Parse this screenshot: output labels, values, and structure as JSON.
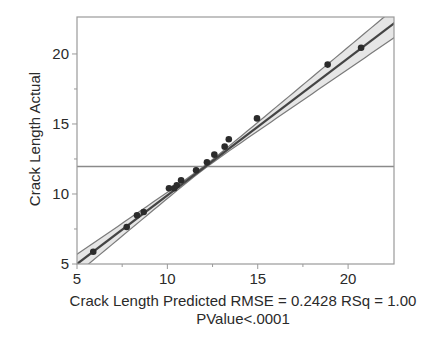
{
  "chart_data": {
    "type": "scatter",
    "title": "",
    "xlabel": "Crack Length Predicted RMSE = 0.2428 RSq = 1.00",
    "xlabel_line2": "PValue<.0001",
    "ylabel": "Crack Length Actual",
    "xlim": [
      5,
      22.54
    ],
    "ylim": [
      5,
      22.64
    ],
    "x_ticks": [
      5,
      10,
      15,
      20
    ],
    "x_minor_ticks": [
      7.5,
      12.5,
      17.5
    ],
    "y_ticks": [
      5,
      10,
      15,
      20
    ],
    "y_minor_ticks": [
      7.5,
      12.5,
      17.5
    ],
    "grid": false,
    "legend": null,
    "points": [
      {
        "x": 5.9,
        "y": 5.88
      },
      {
        "x": 7.75,
        "y": 7.64
      },
      {
        "x": 8.32,
        "y": 8.48
      },
      {
        "x": 8.69,
        "y": 8.71
      },
      {
        "x": 10.09,
        "y": 10.41
      },
      {
        "x": 10.38,
        "y": 10.41
      },
      {
        "x": 10.52,
        "y": 10.62
      },
      {
        "x": 10.76,
        "y": 10.98
      },
      {
        "x": 11.59,
        "y": 11.69
      },
      {
        "x": 12.19,
        "y": 12.26
      },
      {
        "x": 12.6,
        "y": 12.81
      },
      {
        "x": 13.17,
        "y": 13.38
      },
      {
        "x": 13.4,
        "y": 13.91
      },
      {
        "x": 14.96,
        "y": 15.4
      },
      {
        "x": 18.87,
        "y": 19.24
      },
      {
        "x": 20.72,
        "y": 20.44
      }
    ],
    "fit_line": {
      "intercept": 0.1,
      "slope": 0.98
    },
    "confidence_band": {
      "center_x": 12.0,
      "a": 0.012,
      "b": 0.0095
    },
    "mean_line_y": 11.96,
    "stats": {
      "RMSE": 0.2428,
      "RSq": 1.0,
      "PValue": "<.0001"
    }
  },
  "colors": {
    "axis": "#9a9a9a",
    "fit": "#444444",
    "band": "#7a7a7a",
    "band_fill": "#e6e6e6",
    "mean_line": "#8a8a8a",
    "point": "#2b2b2b"
  }
}
